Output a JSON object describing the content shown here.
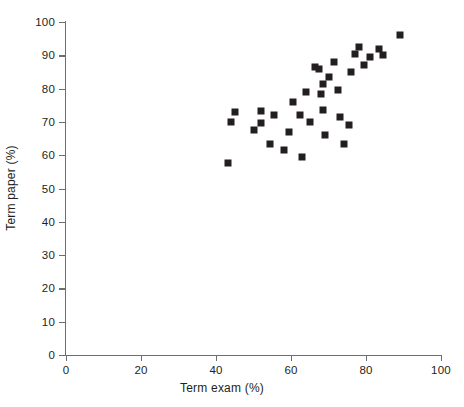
{
  "chart_data": {
    "type": "scatter",
    "title": "",
    "xlabel": "Term exam (%)",
    "ylabel": "Term paper (%)",
    "xlim": [
      0,
      100
    ],
    "ylim": [
      0,
      100
    ],
    "xticks": [
      0,
      20,
      40,
      60,
      80,
      100
    ],
    "yticks": [
      0,
      10,
      20,
      30,
      40,
      50,
      60,
      70,
      80,
      90,
      100
    ],
    "grid": false,
    "legend": null,
    "marker": "square",
    "marker_color": "#231f20",
    "series": [
      {
        "name": "Students",
        "points": [
          [
            43.2,
            57.7
          ],
          [
            44.0,
            70.0
          ],
          [
            45.0,
            73.0
          ],
          [
            50.0,
            67.5
          ],
          [
            52.0,
            73.2
          ],
          [
            52.0,
            69.8
          ],
          [
            54.5,
            63.5
          ],
          [
            55.5,
            72.0
          ],
          [
            58.0,
            61.7
          ],
          [
            59.5,
            67.0
          ],
          [
            60.5,
            76.0
          ],
          [
            62.5,
            72.0
          ],
          [
            63.0,
            59.5
          ],
          [
            64.0,
            79.0
          ],
          [
            65.0,
            70.0
          ],
          [
            66.5,
            86.5
          ],
          [
            67.5,
            86.0
          ],
          [
            68.0,
            78.5
          ],
          [
            68.5,
            73.5
          ],
          [
            68.5,
            81.5
          ],
          [
            69.0,
            66.0
          ],
          [
            70.0,
            83.5
          ],
          [
            71.5,
            88.0
          ],
          [
            72.5,
            79.5
          ],
          [
            73.0,
            71.5
          ],
          [
            74.0,
            63.5
          ],
          [
            75.5,
            69.0
          ],
          [
            76.0,
            85.0
          ],
          [
            77.0,
            90.5
          ],
          [
            78.0,
            92.5
          ],
          [
            79.5,
            87.0
          ],
          [
            81.0,
            89.5
          ],
          [
            83.5,
            92.0
          ],
          [
            84.5,
            90.0
          ],
          [
            89.0,
            96.0
          ]
        ]
      }
    ]
  },
  "axes": {
    "x_title": "Term exam (%)",
    "y_title": "Term paper (%)"
  }
}
